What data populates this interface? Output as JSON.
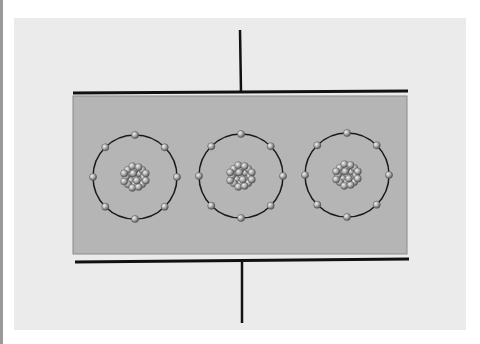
{
  "diagram": {
    "type": "parallel-plate-capacitor-with-atoms",
    "colors": {
      "background": "#ebebeb",
      "dielectric": "#b5b5b5",
      "plate": "#111111",
      "orbit": "#1a1a1a",
      "electron": "#9a9a9a"
    },
    "atoms": [
      {
        "cx": 135,
        "cy": 177,
        "r": 42,
        "electrons": 8
      },
      {
        "cx": 241,
        "cy": 176,
        "r": 42,
        "electrons": 8
      },
      {
        "cx": 347,
        "cy": 175,
        "r": 42,
        "electrons": 8
      }
    ]
  }
}
